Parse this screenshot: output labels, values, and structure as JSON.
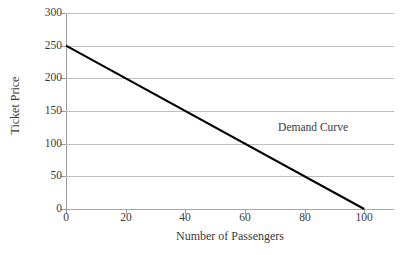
{
  "chart_data": {
    "type": "line",
    "title": "",
    "xlabel": "Number of Passengers",
    "ylabel": "Ticket Price",
    "xlim": [
      0,
      110
    ],
    "ylim": [
      0,
      300
    ],
    "xticks": [
      0,
      20,
      40,
      60,
      80,
      100
    ],
    "xtick_labels": [
      "0",
      "20",
      "40",
      "60",
      "80",
      "100"
    ],
    "yticks": [
      0,
      50,
      100,
      150,
      200,
      250,
      300
    ],
    "ytick_labels": [
      "0",
      "50",
      "100",
      "150",
      "200",
      "250",
      "300"
    ],
    "grid": "horizontal",
    "legend": "none",
    "annotations": [
      {
        "text": "Demand Curve",
        "x": 49,
        "y": 145
      }
    ],
    "series": [
      {
        "name": "Demand Curve",
        "color": "#000000",
        "linewidth": 2,
        "x": [
          0,
          100
        ],
        "values": [
          250,
          0
        ],
        "points": [
          {
            "x": 0,
            "y": 250
          },
          {
            "x": 20,
            "y": 200
          },
          {
            "x": 40,
            "y": 150
          },
          {
            "x": 60,
            "y": 100
          },
          {
            "x": 80,
            "y": 50
          },
          {
            "x": 100,
            "y": 0
          }
        ]
      }
    ],
    "colors": {
      "line": "#000000",
      "grid": "#bdbdbd",
      "axis": "#9a9a9a",
      "text": "#3a3a3a",
      "background": "#ffffff"
    }
  }
}
